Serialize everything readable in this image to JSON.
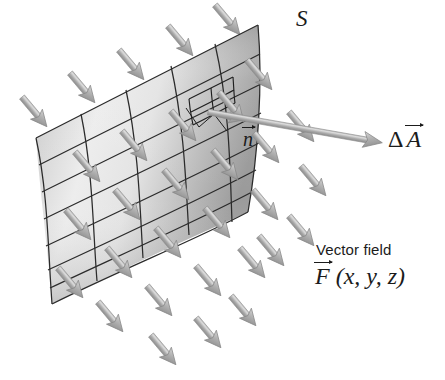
{
  "figure": {
    "background": "#ffffff",
    "width": 445,
    "height": 380
  },
  "labels": {
    "surface": "S",
    "normal": "n",
    "area_element_delta": "Δ",
    "area_element_symbol": "A",
    "vector_field_caption": "Vector field",
    "field_symbol": "F",
    "field_args": "(x, y, z)"
  },
  "colors": {
    "arrow_fill": "#aeaeae",
    "arrow_fill_light": "#d2d2d2",
    "arrow_fill_dark": "#8e8e8e",
    "arrow_edge": "#8a8a8a",
    "surface_light": "#ececec",
    "surface_mid": "#cfcfcf",
    "surface_dark": "#9e9e9e",
    "grid_line": "#2b2b2b",
    "text": "#1b1b1b"
  },
  "surface": {
    "name": "S",
    "columns": 5,
    "rows": 7,
    "patch_subdivisions": 2,
    "corners": {
      "top_left": [
        36,
        138
      ],
      "top_right": [
        258,
        25
      ],
      "bottom_right": [
        248,
        212
      ],
      "bottom_left": [
        52,
        304
      ]
    }
  },
  "vectors": {
    "normal": {
      "from": [
        208,
        112
      ],
      "to": [
        250,
        123
      ],
      "label": "n"
    },
    "area": {
      "from": [
        208,
        112
      ],
      "to": [
        383,
        143
      ],
      "label": "ΔA"
    }
  },
  "field_arrows": {
    "direction_deg": 50,
    "count": 34,
    "description": "uniform vector field arrows pointing down-right, passing through surface S"
  }
}
